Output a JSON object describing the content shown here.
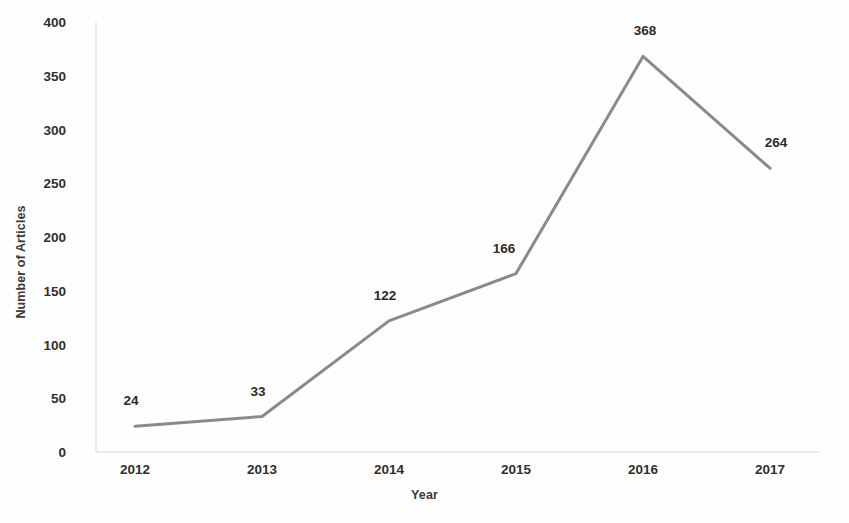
{
  "chart_data": {
    "type": "line",
    "title": "",
    "xlabel": "Year",
    "ylabel": "Number of Articles",
    "categories": [
      "2012",
      "2013",
      "2014",
      "2015",
      "2016",
      "2017"
    ],
    "x": [
      2012,
      2013,
      2014,
      2015,
      2016,
      2017
    ],
    "values": [
      24,
      33,
      122,
      166,
      368,
      264
    ],
    "series": [
      {
        "name": "Number of Articles",
        "values": [
          24,
          33,
          122,
          166,
          368,
          264
        ],
        "color": "#8a8a8a",
        "marker": "none",
        "line_width": 3
      }
    ],
    "data_labels": [
      "24",
      "33",
      "122",
      "166",
      "368",
      "264"
    ],
    "data_labels_shown": true,
    "yticks": [
      0,
      50,
      100,
      150,
      200,
      250,
      300,
      350,
      400
    ],
    "ytick_labels": [
      "0",
      "50",
      "100",
      "150",
      "200",
      "250",
      "300",
      "350",
      "400"
    ],
    "xtick_labels": [
      "2012",
      "2013",
      "2014",
      "2015",
      "2016",
      "2017"
    ],
    "ylim": [
      0,
      400
    ],
    "grid": false,
    "legend": false,
    "legend_position": "none",
    "axis_color": "#d8d8d8",
    "text_color": "#2f2f2f",
    "background": "#fefefe"
  },
  "axes": {
    "y_title": "Number of Articles",
    "x_title": "Year"
  }
}
